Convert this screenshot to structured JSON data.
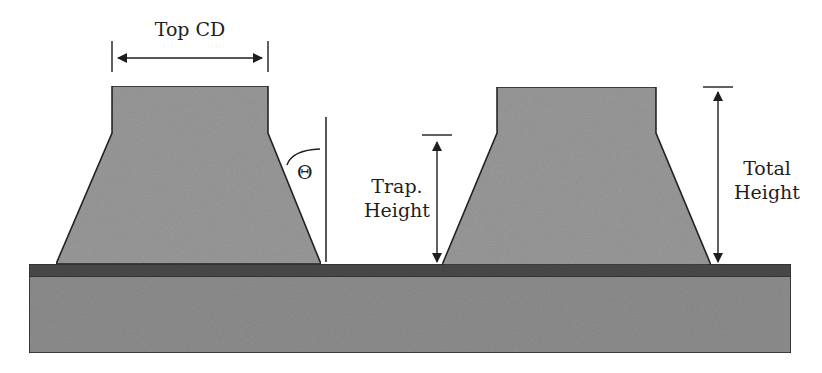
{
  "diagram": {
    "labels": {
      "top_cd": "Top CD",
      "theta": "Θ",
      "trap_height_line1": "Trap.",
      "trap_height_line2": "Height",
      "total_height_line1": "Total",
      "total_height_line2": "Height"
    },
    "colors": {
      "background": "#ffffff",
      "feature_fill": "#9a9a9a",
      "substrate_fill": "#8e8e8e",
      "film_layer_fill": "#4a4a4a",
      "outline": "#222222",
      "annotation": "#1e1e1e"
    },
    "shapes": {
      "left_feature": "112,86 268,86 268,133 321,264 56,264 112,133",
      "right_feature": "497,87 656,87 656,133 711,265 442,265 497,133"
    }
  }
}
